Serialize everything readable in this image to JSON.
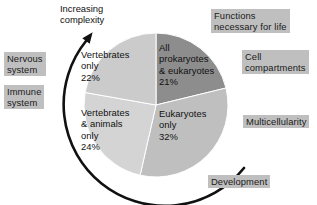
{
  "figure": {
    "kind": "annotated-pie-diagram",
    "background": "#ffffff"
  },
  "annotations": {
    "increasing_complexity": "Increasing\ncomplexity",
    "arrow_direction": "counterclockwise-upward"
  },
  "callouts": [
    {
      "id": "nervous-system",
      "text": "Nervous\nsystem",
      "x": 4,
      "y": 52
    },
    {
      "id": "immune-system",
      "text": "Immune\nsystem",
      "x": 4,
      "y": 85
    },
    {
      "id": "functions-for-life",
      "text": "Functions\nnecessary for life",
      "x": 211,
      "y": 9
    },
    {
      "id": "cell-compartments",
      "text": "Cell\ncompartments",
      "x": 242,
      "y": 50
    },
    {
      "id": "multicellularity",
      "text": "Multicellularity",
      "x": 243,
      "y": 115
    },
    {
      "id": "development",
      "text": "Development",
      "x": 208,
      "y": 175
    }
  ],
  "chart_data": {
    "type": "pie",
    "title": "",
    "unit": "%",
    "legend_position": "in-slice",
    "total": 99,
    "start_angle_deg": 0,
    "direction": "clockwise",
    "center": {
      "x": 156,
      "y": 105
    },
    "radius": 72,
    "slices": [
      {
        "name": "All prokaryotes & eukaryotes",
        "label": "All\nprokaryotes\n& eukaryotes\n21%",
        "value": 21,
        "color": "#8d8d8d",
        "label_x": 159,
        "label_y": 42
      },
      {
        "name": "Eukaryotes only",
        "label": "Eukaryotes\nonly\n32%",
        "value": 32,
        "color": "#bfbfbf",
        "label_x": 159,
        "label_y": 108
      },
      {
        "name": "Vertebrates & animals only",
        "label": "Vertebrates\n& animals\nonly\n24%",
        "value": 24,
        "color": "#d4d4d4",
        "label_x": 81,
        "label_y": 107
      },
      {
        "name": "Vertebrates only",
        "label": "Vertebrates\nonly\n22%",
        "value": 22,
        "color": "#cbcbcb",
        "label_x": 81,
        "label_y": 49
      }
    ]
  }
}
